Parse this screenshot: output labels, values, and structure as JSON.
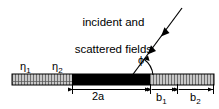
{
  "figure": {
    "type": "scattering-geometry-diagram",
    "width": 219,
    "height": 109,
    "background_color": "#ffffff",
    "line_color": "#000000"
  },
  "caption": {
    "line1": "incident and",
    "line2": "scattered fields",
    "full_text": "incident and scattered fields"
  },
  "labels": {
    "eta1": "η",
    "eta1_sub": "1",
    "eta2": "η",
    "eta2_sub": "2",
    "phi": "ϕ"
  },
  "dimensions": [
    {
      "name": "2a",
      "label": "2a",
      "sub": "",
      "start_x": 72,
      "end_x": 150
    },
    {
      "name": "b1",
      "label": "b",
      "sub": "1",
      "start_x": 153,
      "end_x": 176
    },
    {
      "name": "b2",
      "label": "b",
      "sub": "2",
      "start_x": 180,
      "end_x": 214
    }
  ],
  "structure": {
    "bar_top": 74,
    "bar_bottom": 85,
    "segments": [
      {
        "name": "hatched-left",
        "fill": "hatched",
        "x0": 12,
        "x1": 72,
        "color": "#b4b4b4"
      },
      {
        "name": "black-center",
        "fill": "solid",
        "x0": 72,
        "x1": 150,
        "color": "#000000"
      },
      {
        "name": "hatched-right",
        "fill": "hatched",
        "x0": 150,
        "x1": 214,
        "color": "#b4b4b4"
      }
    ]
  },
  "ray": {
    "name": "incident-scattered-ray",
    "from_x": 131,
    "from_y": 77,
    "to_x": 182,
    "to_y": 8,
    "arrowhead_count": 2,
    "direction": "down-left"
  },
  "angle_arc": {
    "name": "phi-angle-arc",
    "vertex_x": 131,
    "vertex_y": 77,
    "radius": 22,
    "from_deg": 0,
    "to_deg": 54
  }
}
